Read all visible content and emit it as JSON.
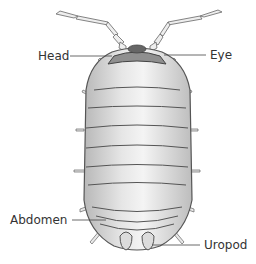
{
  "diagram": {
    "labels": {
      "head": "Head",
      "eye": "Eye",
      "abdomen": "Abdomen",
      "uropod": "Uropod"
    },
    "colors": {
      "body_fill": "#d8d8d8",
      "body_highlight": "#f2f2f2",
      "outline": "#555555",
      "head_fill": "#9a9a9a",
      "label_text": "#333333",
      "leader_line": "#444444"
    }
  }
}
